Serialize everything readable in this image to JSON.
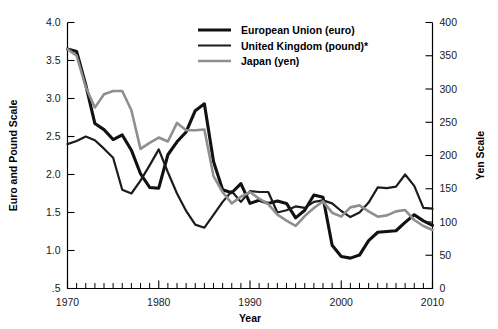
{
  "chart_data": {
    "type": "line",
    "title": "",
    "xlabel": "Year",
    "ylabel": "Euro and Pound Scale",
    "ylabel_right": "Yen Scale",
    "xlim": [
      1970,
      2010
    ],
    "ylim": [
      0.5,
      4.0
    ],
    "ylim_right": [
      0,
      400
    ],
    "grid": false,
    "legend_position": "top-center",
    "x_tick_labels": [
      "1970",
      "1980",
      "1990",
      "2000",
      "2010"
    ],
    "x_ticks": [
      1970,
      1980,
      1990,
      2000,
      2010
    ],
    "x_minor_tick_interval": 1,
    "y_left_tick_labels": [
      "4.0",
      "3.5",
      "3.0",
      "2.5",
      "2.0",
      "1.5",
      "1.0",
      ".5"
    ],
    "y_left_ticks": [
      4.0,
      3.5,
      3.0,
      2.5,
      2.0,
      1.5,
      1.0,
      0.5
    ],
    "y_right_tick_labels": [
      "400",
      "350",
      "300",
      "250",
      "200",
      "150",
      "100",
      "50",
      "0"
    ],
    "y_right_ticks": [
      400,
      350,
      300,
      250,
      200,
      150,
      100,
      50,
      0
    ],
    "x": [
      1970,
      1971,
      1972,
      1973,
      1974,
      1975,
      1976,
      1977,
      1978,
      1979,
      1980,
      1981,
      1982,
      1983,
      1984,
      1985,
      1986,
      1987,
      1988,
      1989,
      1990,
      1991,
      1992,
      1993,
      1994,
      1995,
      1996,
      1997,
      1998,
      1999,
      2000,
      2001,
      2002,
      2003,
      2004,
      2005,
      2006,
      2007,
      2008,
      2009,
      2010
    ],
    "series": [
      {
        "name": "European Union (euro)",
        "axis": "left",
        "color": "#111111",
        "width": 3.1,
        "values": [
          3.65,
          3.62,
          3.18,
          2.67,
          2.59,
          2.46,
          2.52,
          2.32,
          2.01,
          1.83,
          1.82,
          2.26,
          2.43,
          2.56,
          2.84,
          2.93,
          2.17,
          1.8,
          1.76,
          1.88,
          1.62,
          1.66,
          1.62,
          1.65,
          1.62,
          1.43,
          1.53,
          1.73,
          1.7,
          1.07,
          0.92,
          0.9,
          0.94,
          1.13,
          1.24,
          1.25,
          1.26,
          1.37,
          1.47,
          1.39,
          1.33
        ]
      },
      {
        "name": "United Kingdom (pound)*",
        "axis": "left",
        "color": "#1c1c1c",
        "width": 2.2,
        "values": [
          2.4,
          2.44,
          2.5,
          2.45,
          2.34,
          2.22,
          1.8,
          1.75,
          1.92,
          2.12,
          2.33,
          2.03,
          1.75,
          1.52,
          1.34,
          1.3,
          1.47,
          1.64,
          1.78,
          1.64,
          1.78,
          1.77,
          1.77,
          1.5,
          1.53,
          1.58,
          1.56,
          1.64,
          1.66,
          1.62,
          1.52,
          1.44,
          1.5,
          1.63,
          1.83,
          1.82,
          1.84,
          2.0,
          1.85,
          1.56,
          1.55
        ]
      },
      {
        "name": "Japan (yen)",
        "axis": "right",
        "color": "#8f8f8f",
        "width": 2.6,
        "values": [
          360,
          350,
          303,
          272,
          292,
          297,
          297,
          268,
          210,
          219,
          227,
          221,
          249,
          238,
          238,
          239,
          169,
          145,
          128,
          138,
          145,
          135,
          127,
          111,
          102,
          94,
          109,
          121,
          131,
          114,
          108,
          122,
          125,
          116,
          108,
          110,
          116,
          118,
          103,
          94,
          88
        ]
      }
    ]
  },
  "legend": {
    "items": [
      {
        "label": "European Union (euro)"
      },
      {
        "label": "United Kingdom (pound)*"
      },
      {
        "label": "Japan (yen)"
      }
    ]
  },
  "axes": {
    "left_title": "Euro and Pound Scale",
    "right_title": "Yen Scale",
    "bottom_title": "Year"
  }
}
